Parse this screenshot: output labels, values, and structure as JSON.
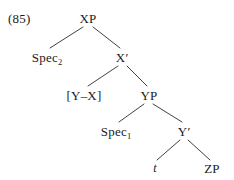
{
  "figure": {
    "example_number": "(85)",
    "width": 234,
    "height": 180,
    "background_color": "#ffffff",
    "line_color": "#2b2b2b",
    "text_color": "#1a1a1a"
  },
  "tree": {
    "type": "x-bar-syntax-tree",
    "nodes": [
      {
        "id": "xp",
        "label": "XP",
        "x": 88,
        "y": 18
      },
      {
        "id": "spec2",
        "label": "Spec",
        "sub": "2",
        "x": 47,
        "y": 57
      },
      {
        "id": "xbar",
        "label": "X",
        "prime": "′",
        "x": 122,
        "y": 57
      },
      {
        "id": "yx",
        "label": "[Y–X]",
        "x": 84,
        "y": 95
      },
      {
        "id": "yp",
        "label": "YP",
        "x": 149,
        "y": 95
      },
      {
        "id": "spec1",
        "label": "Spec",
        "sub": "1",
        "x": 116,
        "y": 131
      },
      {
        "id": "ybar",
        "label": "Y",
        "prime": "′",
        "x": 184,
        "y": 131
      },
      {
        "id": "trace",
        "label": "t",
        "x": 155,
        "y": 168,
        "italic": true
      },
      {
        "id": "zp",
        "label": "ZP",
        "x": 212,
        "y": 168
      }
    ],
    "edges": [
      {
        "from": "xp",
        "to": "spec2",
        "x1": 83,
        "y1": 27,
        "x2": 50,
        "y2": 48
      },
      {
        "from": "xp",
        "to": "xbar",
        "x1": 93,
        "y1": 27,
        "x2": 120,
        "y2": 48
      },
      {
        "from": "xbar",
        "to": "yx",
        "x1": 118,
        "y1": 66,
        "x2": 88,
        "y2": 86
      },
      {
        "from": "xbar",
        "to": "yp",
        "x1": 127,
        "y1": 66,
        "x2": 147,
        "y2": 86
      },
      {
        "from": "yp",
        "to": "spec1",
        "x1": 144,
        "y1": 104,
        "x2": 119,
        "y2": 122
      },
      {
        "from": "yp",
        "to": "ybar",
        "x1": 153,
        "y1": 104,
        "x2": 182,
        "y2": 122
      },
      {
        "from": "ybar",
        "to": "trace",
        "x1": 180,
        "y1": 140,
        "x2": 157,
        "y2": 160
      },
      {
        "from": "ybar",
        "to": "zp",
        "x1": 188,
        "y1": 140,
        "x2": 210,
        "y2": 160
      }
    ]
  },
  "example_label_position": {
    "x": 8,
    "y": 12
  }
}
